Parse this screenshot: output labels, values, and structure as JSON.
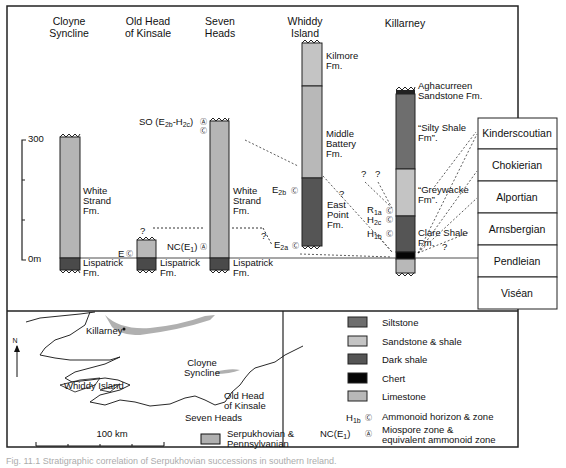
{
  "figure": {
    "localities": [
      {
        "id": "cloyne",
        "name_lines": [
          "Cloyne",
          "Syncline"
        ]
      },
      {
        "id": "oldhead",
        "name_lines": [
          "Old Head",
          "of Kinsale"
        ]
      },
      {
        "id": "sevenheads",
        "name_lines": [
          "Seven",
          "Heads"
        ]
      },
      {
        "id": "whiddy",
        "name_lines": [
          "Whiddy",
          "Island"
        ]
      },
      {
        "id": "killarney",
        "name_lines": [
          "Killarney"
        ]
      }
    ],
    "scale": {
      "top_label": "300",
      "bottom_label": "0m",
      "unit": "m",
      "max": 300
    },
    "formations": {
      "cloyne_white": [
        "White",
        "Strand",
        "Fm."
      ],
      "cloyne_lisp": [
        "Lispatrick",
        "Fm."
      ],
      "oldhead_lisp": [
        "Lispatrick",
        "Fm."
      ],
      "seven_white": [
        "White",
        "Strand",
        "Fm."
      ],
      "seven_lisp": [
        "Lispatrick",
        "Fm."
      ],
      "whiddy_kilmore": [
        "Kilmore",
        "Fm."
      ],
      "whiddy_middle": [
        "Middle",
        "Battery",
        "Fm."
      ],
      "whiddy_east": [
        "East",
        "Point",
        "Fm."
      ],
      "kill_agha": [
        "Aghacurreen",
        "Sandstone Fm."
      ],
      "kill_silty": [
        "“Silty Shale",
        "Fm”."
      ],
      "kill_grey": [
        "“Greywacke",
        "Fm”."
      ],
      "kill_clare": [
        "Clare Shale",
        "Fm."
      ]
    },
    "zones": {
      "so": {
        "main": "SO (E",
        "sub1": "2b",
        "mid": "-H",
        "sub2": "2c",
        "end": ")"
      },
      "nc": {
        "main": "NC(E",
        "sub1": "1",
        "end": ")"
      },
      "e": {
        "main": "E"
      },
      "e2b": {
        "main": "E",
        "sub1": "2b"
      },
      "e2a": {
        "main": "E",
        "sub1": "2a"
      },
      "r1a": {
        "main": "R",
        "sub1": "1a"
      },
      "h2c": {
        "main": "H",
        "sub1": "2c"
      },
      "h1b": {
        "main": "H",
        "sub1": "1b"
      },
      "question": "?"
    },
    "stages": [
      "Kinderscoutian",
      "Chokierian",
      "Alportian",
      "Arnsbergian",
      "Pendleian",
      "Viséan"
    ]
  },
  "map": {
    "north_label": "N",
    "scale_label": "100 km",
    "place_labels": {
      "killarney": "Killarney",
      "whiddy": "Whiddy Island",
      "cloyne": [
        "Cloyne",
        "Syncline"
      ],
      "oldhead": [
        "Old Head",
        "of Kinsale"
      ],
      "seven": "Seven Heads"
    },
    "shaded_legend": [
      "Serpukhovian &",
      "Pennsylvanian"
    ]
  },
  "legend": {
    "items": [
      {
        "label": "Siltstone",
        "color": "#6e6e6e"
      },
      {
        "label": "Sandstone & shale",
        "color": "#c4c4c4"
      },
      {
        "label": "Dark shale",
        "color": "#555555"
      },
      {
        "label": "Chert",
        "color": "#050505"
      },
      {
        "label": "Limestone",
        "color": "#b8b8b8"
      }
    ],
    "ammonoid": {
      "sym_main": "H",
      "sym_sub": "1b",
      "label": "Ammonoid horizon & zone"
    },
    "miospore": {
      "sym_main": "NC(E",
      "sym_sub": "1",
      "sym_end": ")",
      "label_lines": [
        "Miospore zone &",
        "equivalent ammonoid zone"
      ]
    }
  },
  "colors": {
    "white_strand": "#b5b5b5",
    "lispatrick": "#4a4a4a",
    "siltstone": "#6e6e6e",
    "sandstone": "#c4c4c4",
    "dark_shale": "#555555",
    "chert": "#050505",
    "limestone": "#b8b8b8",
    "map_shade": "#b0b0b0"
  },
  "caption": "Fig. 11.1 Stratigraphic correlation of Serpukhovian successions in southern Ireland."
}
